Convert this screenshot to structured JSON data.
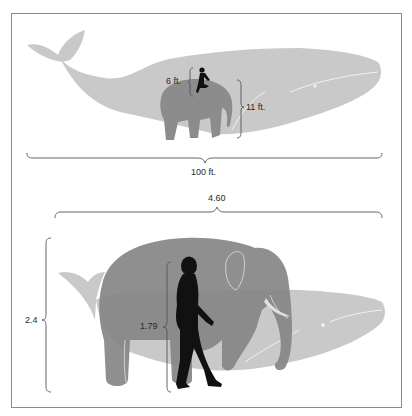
{
  "figure": {
    "colors": {
      "frame": "#8a8a8a",
      "whale": "#c9c9c9",
      "elephant": "#8c8c8c",
      "human": "#111111",
      "bracket": "#555555"
    },
    "top_panel": {
      "units": "ft.",
      "labels": {
        "human_height": "6 ft.",
        "elephant_height": "11 ft.",
        "whale_length": "100 ft."
      }
    },
    "bottom_panel": {
      "units": "m",
      "labels": {
        "elephant_length": "4.60",
        "elephant_height": "2.4",
        "human_height": "1.79"
      }
    }
  }
}
